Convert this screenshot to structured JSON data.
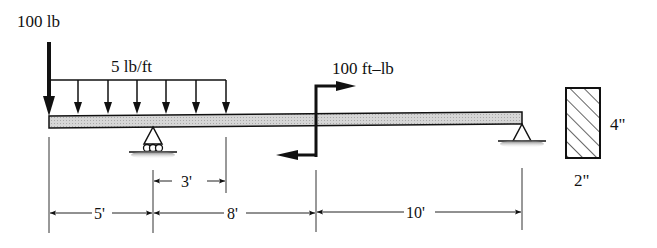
{
  "diagram": {
    "type": "beam-loading",
    "point_load": {
      "label": "100 lb",
      "position_ft": 0,
      "direction": "down"
    },
    "distributed_load": {
      "label": "5 lb/ft",
      "from_ft": 0,
      "to_ft": 8,
      "arrow_count": 7
    },
    "moment": {
      "label": "100 ft–lb",
      "position_ft": 13
    },
    "supports": [
      {
        "type": "roller",
        "position_ft": 5
      },
      {
        "type": "pin",
        "position_ft": 23
      }
    ],
    "dimensions": {
      "d1": "5'",
      "d2": "8'",
      "d3": "10'",
      "d_load_extra": "3'"
    },
    "cross_section": {
      "width_label": "2\"",
      "height_label": "4\""
    }
  }
}
